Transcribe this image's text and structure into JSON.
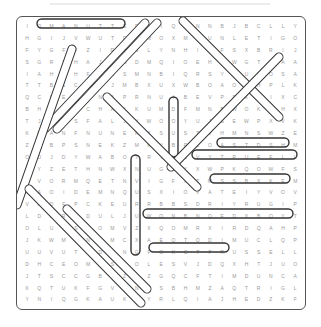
{
  "puzzle": {
    "type": "word-search",
    "rows": 24,
    "cols": 23,
    "grid": [
      "IOMANUTTEDEIQWNNBJBCLLYMG",
      "HGIJVWUTFKMOXMVUNLETIGOWNUPL",
      "FYGFFZIRISLYNHIZFSXBRIJL",
      "SGRTHAJCWDMQIOEHZWGTSAAS",
      "IAHFHFDCSMNBIQRSYFUQOSAWZMEN",
      "TTBECKSJMBXUXWBOAOBHPLKA",
      "QCUEFTNAPRNUIBEVPDKDIXCS",
      "BHENRCHAIKUMDFMNBWOKYHXF",
      "TJPKSFALJVWOOYUJSEWPXVKG",
      "KDANFNUNEKXSUSTVHMNSWZEF",
      "ZDBPSNEKZMKVBRZOASTDSHMI",
      "OOJDYWABOYRTNLVYTPUEFLLN",
      "QYZETHNWXNUGAYXWPKQOWFSO",
      "NVORMQETNVIGFXTMSSBXKEMI",
      "HAOIDEMNQUSXIOVATEIYVOVZ",
      "VRDFPCKEURRBBSDRIYRUGIPDH",
      "LDARTDULJUWONBNQFDXBQYTMS",
      "OLUUSBOMVZXQOMRXIRDQAHPJ",
      "JKWMANWMCXAEQTODIMUCLQPFS",
      "UUVUTXDYNGFOKCTFRUSSELLWESTBROOK",
      "DHCEOMTSCOLESVJDQXHTJUOI",
      "JTSCCGBJZPZGQCFTIMDUNCANS",
      "KQTUKFGVKNZSBHMZAQTRIGLP",
      "YNIQGKAUKJYRLQIAJHEDZKFE"
    ],
    "found_words": [
      {
        "word": "MANUTTEDE",
        "direction": "horizontal"
      },
      {
        "word": "KEMIT",
        "direction": "horizontal"
      },
      {
        "word": "OLAJUWON",
        "direction": "horizontal"
      },
      {
        "word": "RUSSELLWESTBROOK",
        "direction": "horizontal"
      },
      {
        "word": "TIMDUNCAN",
        "direction": "horizontal"
      }
    ],
    "highlight_color": "#333333",
    "letter_color": "#9a9a9a"
  }
}
